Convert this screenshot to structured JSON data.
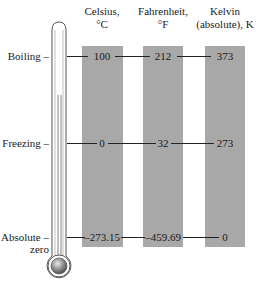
{
  "diagram": {
    "columns": [
      {
        "id": "celsius",
        "heading_line1": "Celsius,",
        "heading_line2": "°C"
      },
      {
        "id": "fahrenheit",
        "heading_line1": "Fahrenheit,",
        "heading_line2": "°F"
      },
      {
        "id": "kelvin",
        "heading_line1": "Kelvin",
        "heading_line2": "(absolute), K"
      }
    ],
    "rows": [
      {
        "id": "boiling",
        "label_line1": "Boiling –",
        "label_line2": "",
        "celsius": "100",
        "fahrenheit": "212",
        "kelvin": "373"
      },
      {
        "id": "freezing",
        "label_line1": "Freezing –",
        "label_line2": "",
        "celsius": "0",
        "fahrenheit": "32",
        "kelvin": "273"
      },
      {
        "id": "absolute-zero",
        "label_line1": "Absolute –",
        "label_line2": "zero",
        "celsius": "–273.15",
        "fahrenheit": "–459.69",
        "kelvin": "0"
      }
    ],
    "colors": {
      "bar": "#a8a8a8",
      "line": "#222222",
      "thermometer_outline": "#555555",
      "bulb": "#9a9a9a"
    }
  }
}
